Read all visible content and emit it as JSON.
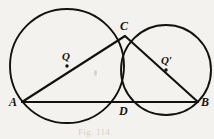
{
  "figure": {
    "type": "geometry-diagram",
    "background_color": "#f4f2ee",
    "ink_color": "#14120f",
    "caption": "Fig. 114."
  },
  "points": [
    {
      "id": "A",
      "label": "A",
      "x": 22,
      "y": 102,
      "label_x": 9,
      "label_y": 96,
      "size": "label-lg"
    },
    {
      "id": "B",
      "label": "B",
      "x": 198,
      "y": 102,
      "label_x": 201,
      "label_y": 96,
      "size": "label-lg"
    },
    {
      "id": "C",
      "label": "C",
      "x": 125,
      "y": 36,
      "label_x": 120,
      "label_y": 20,
      "size": "label-lg"
    },
    {
      "id": "D",
      "label": "D",
      "x": 124,
      "y": 102,
      "label_x": 119,
      "label_y": 105,
      "size": "label-lg"
    },
    {
      "id": "Q",
      "label": "Q",
      "x": 67,
      "y": 66,
      "label_x": 62,
      "label_y": 51,
      "size": "label-md"
    },
    {
      "id": "Qp",
      "label": "Q′",
      "x": 166,
      "y": 70,
      "label_x": 161,
      "label_y": 55,
      "size": "label-md"
    }
  ],
  "circles": [
    {
      "id": "circle-Q",
      "center_label": "Q",
      "cx": 67,
      "cy": 66,
      "r": 57
    },
    {
      "id": "circle-Qp",
      "center_label": "Q′",
      "cx": 166,
      "cy": 70,
      "r": 45
    }
  ],
  "segments": [
    {
      "id": "segment-AC",
      "from": "A",
      "to": "C",
      "x1": 22,
      "y1": 102,
      "x2": 125,
      "y2": 36
    },
    {
      "id": "segment-CB",
      "from": "C",
      "to": "B",
      "x1": 125,
      "y1": 36,
      "x2": 198,
      "y2": 102
    },
    {
      "id": "segment-AB",
      "from": "A",
      "to": "B",
      "x1": 22,
      "y1": 102,
      "x2": 198,
      "y2": 102
    }
  ],
  "stroke": {
    "circle_width": 1.9,
    "segment_width": 2.1
  }
}
